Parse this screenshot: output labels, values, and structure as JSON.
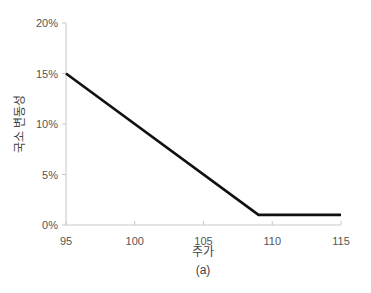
{
  "chart_data": {
    "type": "line",
    "title": "",
    "caption": "(a)",
    "xlabel": "주가",
    "ylabel": "국소 변동성",
    "xlim": [
      95,
      115
    ],
    "ylim": [
      0,
      20
    ],
    "x_ticks": [
      95,
      100,
      105,
      110,
      115
    ],
    "x_tick_labels": [
      "95",
      "100",
      "105",
      "110",
      "115"
    ],
    "y_ticks": [
      0,
      5,
      10,
      15,
      20
    ],
    "y_tick_labels": [
      "0%",
      "5%",
      "10%",
      "15%",
      "20%"
    ],
    "grid": false,
    "legend": null,
    "series": [
      {
        "name": "국소 변동성",
        "color": "#111111",
        "x": [
          95,
          109,
          115
        ],
        "y": [
          15,
          1,
          1
        ]
      }
    ]
  },
  "colors": {
    "axis": "#c8c8c8",
    "line": "#111111",
    "text": "#555555"
  }
}
